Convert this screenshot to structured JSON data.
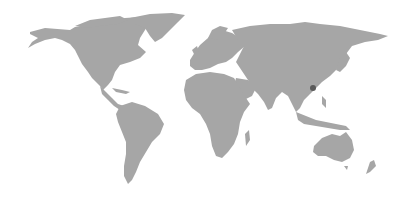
{
  "map": {
    "type": "world-map",
    "background_color": "#ffffff",
    "land_color": "#a6a6a6",
    "marker_color": "#5a5a5a",
    "markers": [
      {
        "x": 313,
        "y": 88,
        "r": 3
      }
    ]
  }
}
